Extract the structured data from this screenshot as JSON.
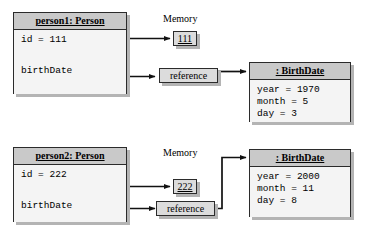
{
  "diagram": {
    "memory_label_1": "Memory",
    "memory_label_2": "Memory",
    "colors": {
      "header_fill": "#c9c9c9",
      "body_fill": "#f4f4f4",
      "cell_fill": "#dcdcdc",
      "border": "#2b2b2b",
      "shadow": "#b4b4b4",
      "text": "#000000"
    }
  },
  "rows": [
    {
      "person": {
        "header": "person1: Person",
        "attributes": [
          {
            "label": "id = 111"
          },
          {
            "label": "birthDate"
          }
        ]
      },
      "memory_label": "Memory",
      "memory_cell": {
        "value": "111"
      },
      "reference_box": {
        "label": "reference"
      },
      "birthdate": {
        "header": ": BirthDate",
        "attributes": [
          {
            "label": "year = 1970"
          },
          {
            "label": "month = 5"
          },
          {
            "label": "day = 3"
          }
        ]
      }
    },
    {
      "person": {
        "header": "person2: Person",
        "attributes": [
          {
            "label": "id = 222"
          },
          {
            "label": "birthDate"
          }
        ]
      },
      "memory_label": "Memory",
      "memory_cell": {
        "value": "222"
      },
      "reference_box": {
        "label": "reference"
      },
      "birthdate": {
        "header": ": BirthDate",
        "attributes": [
          {
            "label": "year = 2000"
          },
          {
            "label": "month = 11"
          },
          {
            "label": "day = 8"
          }
        ]
      }
    }
  ]
}
